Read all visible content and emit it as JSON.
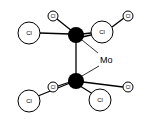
{
  "diagram": {
    "title": "",
    "metal_label": "Mo",
    "metal_color": "#000000",
    "ligand_label": "Cl",
    "atoms": {
      "mo_top": {
        "label": "Mo",
        "x": 76,
        "y": 35,
        "r": 8
      },
      "mo_bottom": {
        "label": "Mo",
        "x": 76,
        "y": 81,
        "r": 8
      },
      "cl_top_left_large": {
        "label": "Cl",
        "x": 29,
        "y": 33,
        "r": 11
      },
      "cl_top_small": {
        "label": "Cl",
        "x": 53,
        "y": 16,
        "r": 5
      },
      "cl_top_right_large": {
        "label": "Cl",
        "x": 102,
        "y": 32,
        "r": 11
      },
      "cl_top_far_right_small": {
        "label": "Cl",
        "x": 128,
        "y": 16,
        "r": 5
      },
      "cl_bottom_left_large": {
        "label": "Cl",
        "x": 29,
        "y": 101,
        "r": 11
      },
      "cl_bottom_small": {
        "label": "Cl",
        "x": 53,
        "y": 87,
        "r": 5
      },
      "cl_bottom_right_large": {
        "label": "Cl",
        "x": 100,
        "y": 100,
        "r": 11
      },
      "cl_bottom_far_right_small": {
        "label": "Cl",
        "x": 128,
        "y": 87,
        "r": 5
      }
    }
  }
}
